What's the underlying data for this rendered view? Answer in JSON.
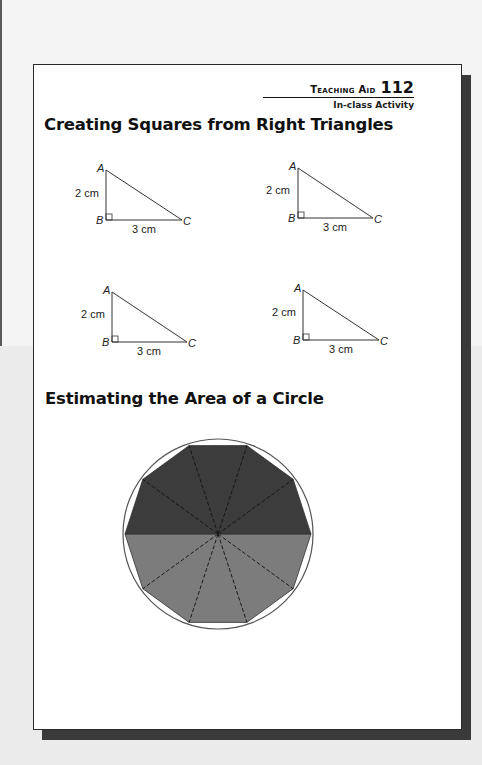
{
  "header": {
    "label": "Teaching Aid",
    "number": "112",
    "subtitle": "In-class Activity"
  },
  "sections": [
    {
      "title": "Creating Squares from Right Triangles",
      "triangles": [
        {
          "vertex_a": "A",
          "vertex_b": "B",
          "vertex_c": "C",
          "side_ab": "2 cm",
          "side_bc": "3 cm"
        },
        {
          "vertex_a": "A",
          "vertex_b": "B",
          "vertex_c": "C",
          "side_ab": "2 cm",
          "side_bc": "3 cm"
        },
        {
          "vertex_a": "A",
          "vertex_b": "B",
          "vertex_c": "C",
          "side_ab": "2 cm",
          "side_bc": "3 cm"
        },
        {
          "vertex_a": "A",
          "vertex_b": "B",
          "vertex_c": "C",
          "side_ab": "2 cm",
          "side_bc": "3 cm"
        }
      ]
    },
    {
      "title": "Estimating the Area of a Circle",
      "figure": {
        "shape": "circle with inscribed decagon divided into 10 triangles",
        "sectors": 10,
        "top_half_color": "#3c3c3c",
        "bottom_half_color": "#7c7c7c"
      }
    }
  ]
}
